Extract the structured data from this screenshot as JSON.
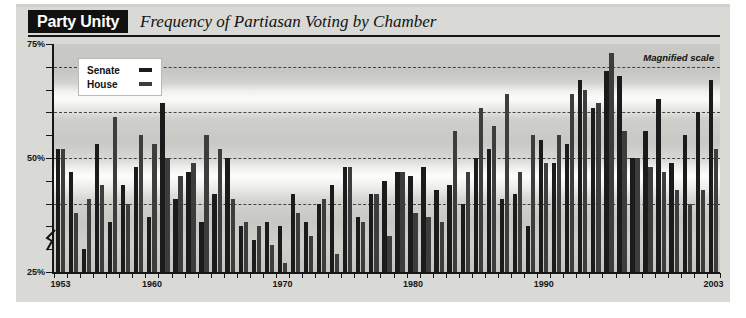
{
  "header": {
    "banner_label": "Party Unity",
    "subtitle": "Frequency of Partiasan Voting by Chamber"
  },
  "annotation": {
    "magnified_scale": "Magnified scale"
  },
  "legend": {
    "items": [
      {
        "label": "Senate",
        "color": "#1b1b1b"
      },
      {
        "label": "House",
        "color": "#3d3d3d"
      }
    ]
  },
  "axes": {
    "y_labels": [
      "75%",
      "50%",
      "25%"
    ],
    "x_labels": [
      "1953",
      "1960",
      "1970",
      "1980",
      "1990",
      "2003"
    ]
  },
  "chart_data": {
    "type": "bar",
    "title": "Frequency of Partiasan Voting by Chamber",
    "subtitle": "Party Unity",
    "annotation": "Magnified scale",
    "xlabel": "",
    "ylabel": "",
    "ylim": [
      25,
      75
    ],
    "y_ticks": [
      25,
      30,
      35,
      40,
      45,
      50,
      55,
      60,
      65,
      70,
      75
    ],
    "y_tick_labels": [
      "25%",
      "50%",
      "75%"
    ],
    "gridlines": [
      40,
      50,
      60,
      70
    ],
    "grid": true,
    "axis_break": true,
    "legend_position": "top-left",
    "categories": [
      1953,
      1954,
      1955,
      1956,
      1957,
      1958,
      1959,
      1960,
      1961,
      1962,
      1963,
      1964,
      1965,
      1966,
      1967,
      1968,
      1969,
      1970,
      1971,
      1972,
      1973,
      1974,
      1975,
      1976,
      1977,
      1978,
      1979,
      1980,
      1981,
      1982,
      1983,
      1984,
      1985,
      1986,
      1987,
      1988,
      1989,
      1990,
      1991,
      1992,
      1993,
      1994,
      1995,
      1996,
      1997,
      1998,
      1999,
      2000,
      2001,
      2002,
      2003
    ],
    "x_tick_labels": [
      "1953",
      "1960",
      "1970",
      "1980",
      "1990",
      "2003"
    ],
    "series": [
      {
        "name": "Senate",
        "color": "#1b1b1b",
        "values": [
          52,
          47,
          30,
          53,
          36,
          44,
          48,
          37,
          62,
          41,
          47,
          36,
          42,
          50,
          35,
          32,
          36,
          35,
          42,
          36,
          40,
          44,
          48,
          37,
          42,
          45,
          47,
          46,
          48,
          43,
          44,
          40,
          50,
          52,
          41,
          42,
          35,
          54,
          49,
          53,
          67,
          61,
          69,
          68,
          50,
          56,
          63,
          49,
          55,
          60,
          67
        ]
      },
      {
        "name": "House",
        "color": "#3d3d3d",
        "values": [
          52,
          38,
          41,
          44,
          59,
          40,
          55,
          53,
          50,
          46,
          49,
          55,
          52,
          41,
          36,
          35,
          31,
          27,
          38,
          33,
          41,
          29,
          48,
          36,
          42,
          33,
          47,
          38,
          37,
          36,
          56,
          47,
          61,
          57,
          64,
          47,
          55,
          49,
          55,
          64,
          65,
          62,
          73,
          56,
          50,
          48,
          47,
          43,
          40,
          43,
          52
        ]
      }
    ]
  }
}
